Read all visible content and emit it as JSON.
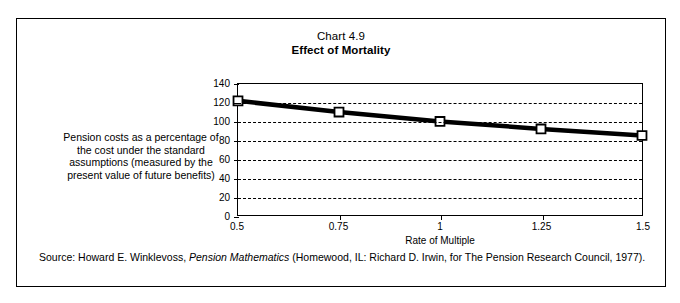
{
  "figure": {
    "chart_number": "Chart 4.9",
    "chart_title": "Effect of Mortality",
    "y_caption": "Pension costs as a percentage of the cost under the standard assumptions (measured by the present value of future benefits)",
    "source_prefix": "Source: Howard E. Winklevoss, ",
    "source_italic": "Pension Mathematics",
    "source_suffix": " (Homewood, IL: Richard D. Irwin, for The Pension Research Council, 1977)."
  },
  "chart_data": {
    "type": "line",
    "title": "Effect of Mortality",
    "subtitle": "Chart 4.9",
    "xlabel": "Rate of Multiple",
    "ylabel": "Pension costs as a percentage of the cost under the standard assumptions (measured by the present value of future benefits)",
    "x": [
      0.5,
      0.75,
      1,
      1.25,
      1.5
    ],
    "xtick_labels": [
      "0.5",
      "0.75",
      "1",
      "1.25",
      "1.5"
    ],
    "values": [
      122,
      110,
      100,
      92,
      85
    ],
    "ytick_labels": [
      "0",
      "20",
      "40",
      "60",
      "80",
      "100",
      "120",
      "140"
    ],
    "yticks": [
      0,
      20,
      40,
      60,
      80,
      100,
      120,
      140
    ],
    "ylim": [
      0,
      140
    ],
    "xlim": [
      0.5,
      1.5
    ],
    "grid": true,
    "grid_style": "dashed-horizontal",
    "legend": "none",
    "marker": "open-square",
    "line_color": "#000000",
    "marker_face_color": "#ffffff"
  }
}
